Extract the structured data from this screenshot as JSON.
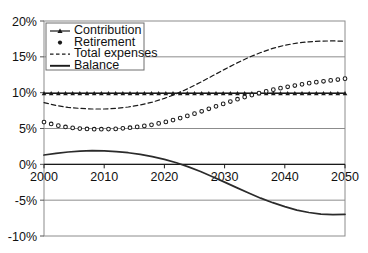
{
  "chart_data": {
    "type": "line",
    "title": "",
    "subtitle": "",
    "xlabel": "",
    "ylabel": "",
    "xlim": [
      2000,
      2050
    ],
    "ylim": [
      -0.1,
      0.2
    ],
    "grid": true,
    "grid_axis": "y",
    "legend_position": "top-left",
    "y_tick_labels": [
      "20%",
      "15%",
      "10%",
      "5%",
      "0%",
      "-5%",
      "-10%"
    ],
    "y_tick_values": [
      0.2,
      0.15,
      0.1,
      0.05,
      0.0,
      -0.05,
      -0.1
    ],
    "x_tick_labels": [
      "2000",
      "2010",
      "2020",
      "2030",
      "2040",
      "2050"
    ],
    "x_tick_values": [
      2000,
      2010,
      2020,
      2030,
      2040,
      2050
    ],
    "x": [
      2000,
      2002,
      2004,
      2006,
      2008,
      2010,
      2012,
      2014,
      2016,
      2018,
      2020,
      2022,
      2024,
      2026,
      2028,
      2030,
      2032,
      2034,
      2036,
      2038,
      2040,
      2042,
      2044,
      2046,
      2048,
      2050
    ],
    "series": [
      {
        "name": "Contribution",
        "style": "solid-with-markers",
        "marker": "triangle",
        "color": "#1a1a1a",
        "values": [
          0.099,
          0.099,
          0.099,
          0.099,
          0.099,
          0.099,
          0.099,
          0.099,
          0.099,
          0.099,
          0.099,
          0.099,
          0.099,
          0.099,
          0.099,
          0.099,
          0.099,
          0.099,
          0.099,
          0.099,
          0.099,
          0.099,
          0.099,
          0.099,
          0.099,
          0.099
        ]
      },
      {
        "name": "Retirement",
        "style": "dotted-with-markers",
        "marker": "circle",
        "color": "#1a1a1a",
        "values": [
          0.059,
          0.0545,
          0.0515,
          0.0498,
          0.049,
          0.049,
          0.0495,
          0.0508,
          0.0527,
          0.0553,
          0.0587,
          0.063,
          0.068,
          0.0735,
          0.0793,
          0.085,
          0.0905,
          0.0955,
          0.1,
          0.104,
          0.1075,
          0.1105,
          0.1132,
          0.1155,
          0.1175,
          0.1195
        ]
      },
      {
        "name": "Total expenses",
        "style": "dashed",
        "marker": "none",
        "color": "#1a1a1a",
        "values": [
          0.086,
          0.0822,
          0.0795,
          0.078,
          0.0772,
          0.0772,
          0.0782,
          0.08,
          0.0828,
          0.0868,
          0.092,
          0.0985,
          0.106,
          0.1145,
          0.1235,
          0.1325,
          0.1412,
          0.1492,
          0.156,
          0.1618,
          0.1662,
          0.1692,
          0.171,
          0.172,
          0.1722,
          0.1718
        ]
      },
      {
        "name": "Balance",
        "style": "solid",
        "marker": "none",
        "color": "#2b2b2b",
        "values": [
          0.013,
          0.0152,
          0.0172,
          0.0185,
          0.019,
          0.0188,
          0.0178,
          0.0162,
          0.0138,
          0.0108,
          0.007,
          0.0022,
          -0.0035,
          -0.01,
          -0.0172,
          -0.0248,
          -0.0325,
          -0.04,
          -0.0472,
          -0.0535,
          -0.059,
          -0.0638,
          -0.0672,
          -0.0694,
          -0.0702,
          -0.0698
        ]
      }
    ],
    "legend_entries": [
      {
        "label": "Contribution",
        "style": "solid-with-markers",
        "marker": "triangle"
      },
      {
        "label": "Retirement",
        "style": "dotted-with-markers",
        "marker": "circle"
      },
      {
        "label": "Total expenses",
        "style": "dashed",
        "marker": "none"
      },
      {
        "label": "Balance",
        "style": "solid",
        "marker": "none"
      }
    ],
    "colors": {
      "plot_background": "#ffffff",
      "frame": "#8c8c8c",
      "gridline": "#8c8c8c",
      "tick_text": "#111111",
      "series_ink": "#1a1a1a",
      "legend_border": "#6e6e6e"
    }
  }
}
